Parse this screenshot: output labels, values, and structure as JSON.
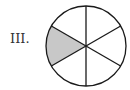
{
  "label": "III.",
  "figure": {
    "type": "circle-divided-into-sectors",
    "sectors": 6,
    "shaded_sectors": 1,
    "shaded_index_description": "left sector",
    "shade_color": "#c8c8c8",
    "stroke_color": "#1a1a1a"
  }
}
